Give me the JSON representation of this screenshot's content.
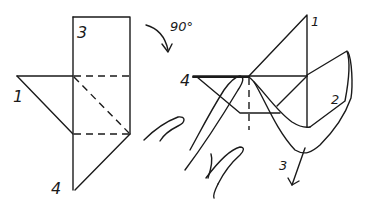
{
  "diagram": {
    "type": "origami fold instruction",
    "left_figure": {
      "labels": {
        "corner_top": "3",
        "corner_left": "1",
        "corner_bottom": "4"
      }
    },
    "rotation": {
      "label": "90°",
      "direction": "clockwise"
    },
    "right_figure": {
      "labels": {
        "corner_top": "1",
        "corner_left": "4",
        "flap": "2",
        "pull_corner": "3"
      },
      "notes": "hand holds corner 4 while corner 3 is pulled down and out"
    }
  },
  "colors": {
    "ink": "#1a1a1a",
    "background": "#ffffff"
  }
}
